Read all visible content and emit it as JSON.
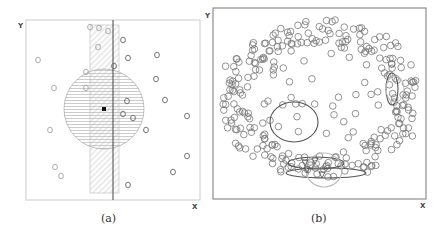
{
  "figure": {
    "panels": [
      {
        "id": "a",
        "caption": "(a)",
        "x_axis_label": "X",
        "y_axis_label": "Y",
        "frame": {
          "x": 26,
          "y": 20,
          "w": 174,
          "h": 180
        },
        "query_point": {
          "x": 104,
          "y": 109
        },
        "range_circle": {
          "cx": 104,
          "cy": 109,
          "r": 40,
          "hatch": "horizontal"
        },
        "strip": {
          "x": 90,
          "y": 25,
          "w": 29,
          "h": 168,
          "hatch": "diagonal"
        },
        "vertical_line_x": 113,
        "points_gray_left": [
          [
            90,
            27
          ],
          [
            99,
            28
          ],
          [
            108,
            31
          ],
          [
            98,
            47
          ],
          [
            38,
            60
          ],
          [
            86,
            72
          ],
          [
            54,
            88
          ],
          [
            86,
            88
          ],
          [
            50,
            130
          ],
          [
            55,
            167
          ],
          [
            61,
            176
          ]
        ],
        "points_dark_right": [
          [
            123,
            40
          ],
          [
            128,
            58
          ],
          [
            157,
            55
          ],
          [
            114,
            66
          ],
          [
            156,
            79
          ],
          [
            127,
            101
          ],
          [
            165,
            100
          ],
          [
            123,
            114
          ],
          [
            133,
            118
          ],
          [
            187,
            116
          ],
          [
            146,
            130
          ],
          [
            187,
            156
          ],
          [
            173,
            172
          ],
          [
            128,
            185
          ]
        ]
      },
      {
        "id": "b",
        "caption": "(b)",
        "x_axis_label": "X",
        "y_axis_label": "Y",
        "frame": {
          "x": 213,
          "y": 8,
          "w": 213,
          "h": 191
        },
        "ellipses": [
          {
            "cx": 294,
            "cy": 122,
            "rx": 24,
            "ry": 20,
            "stroke": "#555"
          },
          {
            "cx": 392,
            "cy": 89,
            "rx": 6,
            "ry": 16,
            "stroke": "#555"
          },
          {
            "cx": 316,
            "cy": 163,
            "rx": 28,
            "ry": 6,
            "stroke": "#555"
          },
          {
            "cx": 326,
            "cy": 173,
            "rx": 40,
            "ry": 5,
            "stroke": "#555"
          },
          {
            "cx": 324,
            "cy": 170,
            "rx": 18,
            "ry": 17,
            "stroke": "#bbb"
          },
          {
            "cx": 395,
            "cy": 89,
            "rx": 9,
            "ry": 13,
            "stroke": "#bbb"
          }
        ],
        "triangles": [
          [
            305,
            163
          ],
          [
            315,
            161
          ],
          [
            322,
            175
          ],
          [
            307,
            170
          ]
        ]
      }
    ]
  }
}
